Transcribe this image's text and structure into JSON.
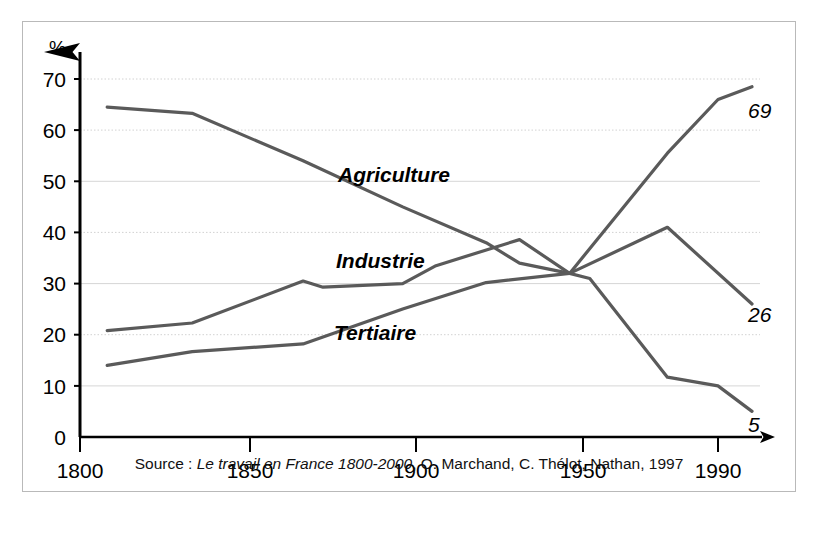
{
  "figure": {
    "background_color": "#ffffff",
    "frame_color": "#b9b9b9",
    "line_color": "#5a5a5a",
    "axis_color": "#000000",
    "gridline_color": "#cfcfcf"
  },
  "axes": {
    "y_unit_label": "%",
    "y_ticks": [
      "0",
      "10",
      "20",
      "30",
      "40",
      "50",
      "60",
      "70"
    ],
    "y_tick_values": [
      0,
      10,
      20,
      30,
      40,
      50,
      60,
      70
    ],
    "x_ticks": [
      "1800",
      "1850",
      "1900",
      "1950",
      "1990"
    ],
    "x_tick_values": [
      1800,
      1850,
      1900,
      1950,
      1990
    ]
  },
  "series_labels": {
    "agriculture": "Agriculture",
    "industrie": "Industrie",
    "tertiaire": "Tertiaire"
  },
  "end_labels": {
    "tertiaire": "69",
    "industrie": "26",
    "agriculture": "5"
  },
  "source": {
    "prefix": "Source : ",
    "title": "Le travail en France 1800-2000",
    "suffix": ", O. Marchand, C. Thélot, Nathan, 1997"
  },
  "chart_data": {
    "type": "line",
    "title": "",
    "subtitle": "",
    "xlabel": "",
    "ylabel": "%",
    "xlim": [
      1800,
      2000
    ],
    "ylim": [
      0,
      75
    ],
    "grid": true,
    "legend_position": "inline-annotations",
    "x_tick_labels": [
      "1800",
      "1850",
      "1900",
      "1950",
      "1990"
    ],
    "y_tick_labels": [
      "0",
      "10",
      "20",
      "30",
      "40",
      "50",
      "60",
      "70"
    ],
    "note": "Part de l'emploi par secteur en France, 1800-2000 (%)",
    "series": [
      {
        "name": "Agriculture",
        "color": "#5a5a5a",
        "end_value_label": "5",
        "points": [
          [
            1808,
            64.5
          ],
          [
            1833,
            63.3
          ],
          [
            1866,
            54.0
          ],
          [
            1896,
            45.0
          ],
          [
            1921,
            38.0
          ],
          [
            1931,
            34.0
          ],
          [
            1946,
            32.0
          ],
          [
            1952,
            31.0
          ],
          [
            1975,
            11.7
          ],
          [
            1990,
            10.0
          ],
          [
            2000,
            5.0
          ]
        ]
      },
      {
        "name": "Industrie",
        "color": "#5a5a5a",
        "end_value_label": "26",
        "points": [
          [
            1808,
            20.8
          ],
          [
            1833,
            22.3
          ],
          [
            1866,
            30.5
          ],
          [
            1872,
            29.3
          ],
          [
            1896,
            30.0
          ],
          [
            1906,
            33.5
          ],
          [
            1931,
            38.6
          ],
          [
            1946,
            32.0
          ],
          [
            1975,
            41.0
          ],
          [
            2000,
            26.0
          ]
        ]
      },
      {
        "name": "Tertiaire",
        "color": "#5a5a5a",
        "end_value_label": "69",
        "points": [
          [
            1808,
            14.0
          ],
          [
            1833,
            16.7
          ],
          [
            1866,
            18.2
          ],
          [
            1896,
            25.0
          ],
          [
            1921,
            30.2
          ],
          [
            1946,
            32.0
          ],
          [
            1975,
            55.5
          ],
          [
            1990,
            66.0
          ],
          [
            2000,
            68.5
          ]
        ]
      }
    ]
  }
}
